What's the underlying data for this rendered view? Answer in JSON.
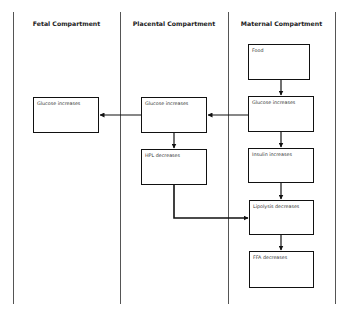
{
  "columns": [
    {
      "id": "fetal",
      "header": "Fetal Compartment"
    },
    {
      "id": "placental",
      "header": "Placental Compartment"
    },
    {
      "id": "maternal",
      "header": "Maternal Compartment"
    }
  ],
  "nodes": {
    "food": "Food",
    "maternal_glucose": "Glucose increases",
    "insulin": "Insulin increases",
    "lipolysis": "Lipolysis decreases",
    "ffa": "FFA decreases",
    "placental_glucose": "Glucose increases",
    "hpl": "HPL decreases",
    "fetal_glucose": "Glucose increases"
  },
  "edges": [
    {
      "from": "food",
      "to": "maternal_glucose"
    },
    {
      "from": "maternal_glucose",
      "to": "insulin"
    },
    {
      "from": "insulin",
      "to": "lipolysis"
    },
    {
      "from": "lipolysis",
      "to": "ffa"
    },
    {
      "from": "maternal_glucose",
      "to": "placental_glucose"
    },
    {
      "from": "placental_glucose",
      "to": "fetal_glucose"
    },
    {
      "from": "placental_glucose",
      "to": "hpl"
    },
    {
      "from": "hpl",
      "to": "lipolysis"
    }
  ]
}
